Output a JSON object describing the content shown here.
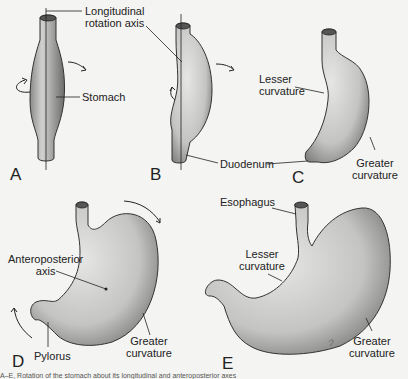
{
  "figure": {
    "panels": [
      "A",
      "B",
      "C",
      "D",
      "E"
    ],
    "labels": {
      "longitudinal_axis": [
        "Longitudinal",
        "rotation axis"
      ],
      "stomach": "Stomach",
      "lesser_curvature_c": [
        "Lesser",
        "curvature"
      ],
      "greater_curvature_c": [
        "Greater",
        "curvature"
      ],
      "duodenum": "Duodenum",
      "anteroposterior_axis": [
        "Anteroposterior",
        "axis"
      ],
      "pylorus": "Pylorus",
      "greater_curvature_d": [
        "Greater",
        "curvature"
      ],
      "esophagus": "Esophagus",
      "lesser_curvature_e": [
        "Lesser",
        "curvature"
      ],
      "greater_curvature_e": [
        "Greater",
        "curvature"
      ]
    },
    "caption": "A–E, Rotation of the stomach about its longitudinal and anteroposterior axes"
  }
}
